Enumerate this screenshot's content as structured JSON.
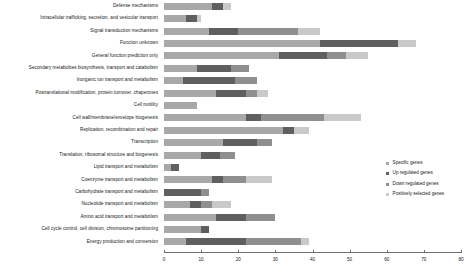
{
  "chart_data": {
    "type": "bar",
    "orientation": "horizontal",
    "stacked": true,
    "title": "",
    "subtitle": "",
    "xlabel": "",
    "ylabel": "",
    "xlim": [
      0,
      80
    ],
    "xticks": [
      0,
      10,
      20,
      30,
      40,
      50,
      60,
      70,
      80
    ],
    "xtick_labels": [
      "0",
      "10",
      "20",
      "30",
      "40",
      "50",
      "60",
      "70",
      "80"
    ],
    "grid": false,
    "legend_position": "right",
    "categories": [
      "Defense mechanisms",
      "Intracellular trafficking, secretion, and vesicular transport",
      "Signal transduction mechanisms",
      "Function unknown",
      "General function prediction only",
      "Secondary metabolites biosynthesis, transport and catabolism",
      "Inorganic ion transport and metabolism",
      "Postranslational modification, protein turnover, chaperones",
      "Cell motility",
      "Cell wall/membrane/envelope biogenesis",
      "Replication, recombination and repair",
      "Transcription",
      "Translation, ribosomal structure and biogenesis",
      "Lipid transport and metabolism",
      "Coenzyme transport and metabolism",
      "Carbohydrate transport and metabolism",
      "Nucleotide transport and metabolism",
      "Amino acid transport and metabolism",
      "Cell cycle control, cell division, chromosome partitioning",
      "Energy production and conversion"
    ],
    "series": [
      {
        "name": "Specific genes",
        "color": "#a8a8a8",
        "values": [
          13,
          6,
          12,
          42,
          31,
          9,
          5,
          14,
          9,
          22,
          32,
          16,
          10,
          2,
          13,
          0,
          7,
          14,
          10,
          6
        ]
      },
      {
        "name": "Up regulated genes",
        "color": "#5f5f5f",
        "values": [
          3,
          3,
          8,
          21,
          13,
          9,
          14,
          8,
          0,
          4,
          3,
          9,
          5,
          2,
          3,
          10,
          3,
          8,
          2,
          16
        ]
      },
      {
        "name": "Down regulated genes",
        "color": "#8f8f8f",
        "values": [
          0,
          0,
          16,
          0,
          5,
          5,
          6,
          3,
          0,
          17,
          0,
          4,
          4,
          0,
          6,
          2,
          3,
          8,
          0,
          15
        ]
      },
      {
        "name": "Positively selected genes",
        "color": "#c9c9c9",
        "values": [
          2,
          1,
          6,
          5,
          6,
          0,
          0,
          3,
          0,
          10,
          4,
          0,
          0,
          0,
          7,
          0,
          5,
          0,
          0,
          2
        ]
      }
    ],
    "totals": [
      18,
      10,
      42,
      68,
      55,
      23,
      25,
      28,
      9,
      53,
      39,
      29,
      19,
      4,
      29,
      12,
      18,
      30,
      12,
      39
    ]
  },
  "legend": {
    "items": [
      {
        "label": "Specific genes",
        "color": "#a8a8a8"
      },
      {
        "label": "Up regulated genes",
        "color": "#5f5f5f"
      },
      {
        "label": "Down regulated genes",
        "color": "#8f8f8f"
      },
      {
        "label": "Positively selected genes",
        "color": "#c9c9c9"
      }
    ]
  }
}
